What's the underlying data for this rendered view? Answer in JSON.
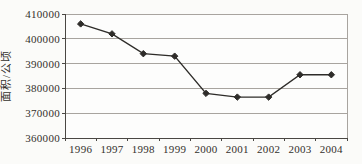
{
  "chart": {
    "title": "",
    "y_axis_title": "面积/公顷",
    "background_color": "#fbfbf9",
    "plot_background_color": "#fdfdfc",
    "grid_color": "#a8a49f",
    "axis_color": "#4a4743",
    "line_color": "#2e2c29",
    "marker_color": "#2e2c29",
    "text_color": "#33302c"
  },
  "chart_data": {
    "type": "line",
    "title": "",
    "xlabel": "",
    "ylabel": "面积/公顷",
    "categories": [
      "1996",
      "1997",
      "1998",
      "1999",
      "2000",
      "2001",
      "2002",
      "2003",
      "2004"
    ],
    "series": [
      {
        "name": "area",
        "values": [
          406000,
          402000,
          394000,
          393000,
          378000,
          376500,
          376500,
          385500,
          385500
        ]
      }
    ],
    "ylim": [
      360000,
      410000
    ],
    "ytick_step": 10000,
    "ytick_labels": [
      "360000",
      "370000",
      "380000",
      "390000",
      "400000",
      "410000"
    ],
    "grid": true,
    "legend": false,
    "marker": "diamond"
  }
}
